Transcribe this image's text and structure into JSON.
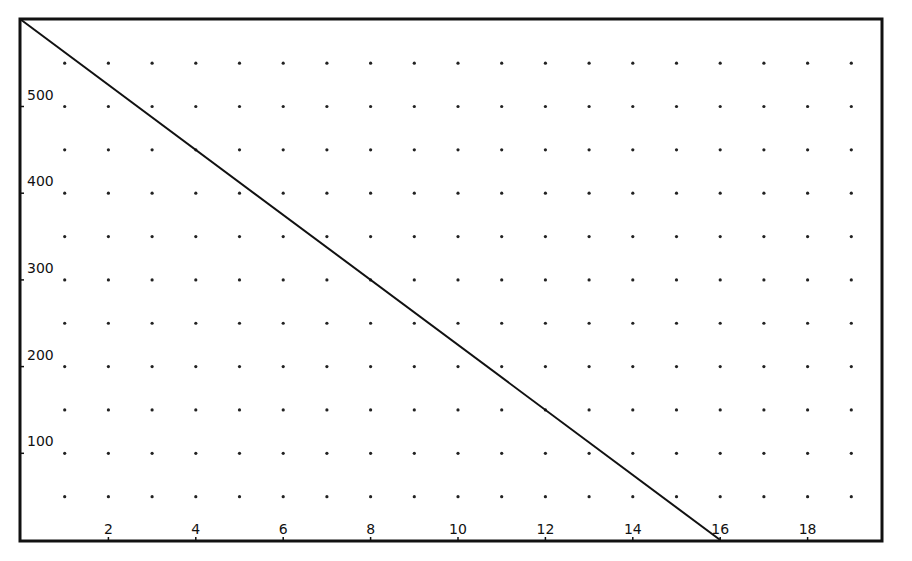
{
  "chart_data": {
    "type": "line",
    "title": "",
    "xlabel": "",
    "ylabel": "",
    "xlim": [
      0,
      19.7
    ],
    "ylim": [
      0,
      605
    ],
    "x_ticks": [
      2,
      4,
      6,
      8,
      10,
      12,
      14,
      16,
      18
    ],
    "y_ticks": [
      100,
      200,
      300,
      400,
      500
    ],
    "x_tick_labels": [
      "2",
      "4",
      "6",
      "8",
      "10",
      "12",
      "14",
      "16",
      "18"
    ],
    "y_tick_labels": [
      "100",
      "200",
      "300",
      "400",
      "500"
    ],
    "grid": "dotted",
    "grid_x": [
      1,
      2,
      3,
      4,
      5,
      6,
      7,
      8,
      9,
      10,
      11,
      12,
      13,
      14,
      15,
      16,
      17,
      18,
      19
    ],
    "grid_y": [
      50,
      100,
      150,
      200,
      250,
      300,
      350,
      400,
      450,
      500,
      550
    ],
    "legend": null,
    "series": [
      {
        "name": "line",
        "x": [
          0,
          16
        ],
        "y": [
          600,
          0
        ],
        "color": "#111111"
      }
    ]
  },
  "colors": {
    "background": "#ffffff",
    "axis": "#111111",
    "grid_dot": "#222222",
    "line": "#111111"
  }
}
